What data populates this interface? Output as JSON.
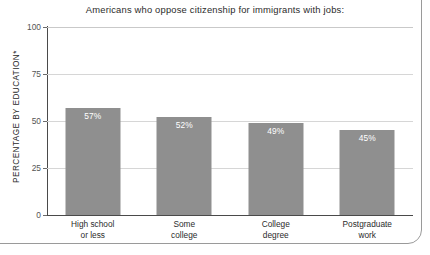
{
  "chart_data": {
    "type": "bar",
    "title": "Americans who oppose citizenship for immigrants with jobs:",
    "xlabel": "",
    "ylabel": "PERCENTAGE BY EDUCATION*",
    "ylim": [
      0,
      100
    ],
    "yticks": [
      "0",
      "25",
      "50",
      "75",
      "100"
    ],
    "grid": true,
    "legend": "none",
    "categories": [
      "High school or less",
      "Some college",
      "College degree",
      "Postgraduate work"
    ],
    "category_lines": [
      [
        "High school",
        "or less"
      ],
      [
        "Some",
        "college"
      ],
      [
        "College",
        "degree"
      ],
      [
        "Postgraduate",
        "work"
      ]
    ],
    "values": [
      57,
      52,
      49,
      45
    ],
    "value_labels": [
      "57%",
      "52%",
      "49%",
      "45%"
    ],
    "colors": {
      "bar": "#8f8f8f",
      "value_label": "#ffffff",
      "gridline": "#d6d6d6",
      "axis": "#4a4a4a",
      "text": "#2b2b2b",
      "background": "#ffffff"
    }
  }
}
